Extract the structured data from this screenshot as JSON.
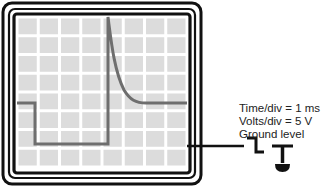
{
  "diagram": {
    "settings": {
      "time_per_div": "Time/div = 1 ms",
      "volts_per_div": "Volts/div = 5 V",
      "ground_label": "Ground level"
    },
    "grid": {
      "columns": 8,
      "rows": 8
    },
    "colors": {
      "frame": "#111111",
      "screen_bg": "#ffffff",
      "grid_cell": "#dcdcdc",
      "trace": "#6e6e6e"
    },
    "trace_description": "Square step down then sharp spike at ~4.3 div with exponential decay back to baseline"
  }
}
